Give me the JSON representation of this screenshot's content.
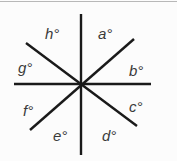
{
  "diagram": {
    "type": "intersecting-lines-angles",
    "center": [
      81,
      84
    ],
    "line_color": "#1a1a1a",
    "label_color": "#3a3a3a",
    "border_color": "#b8b8b8",
    "lines": [
      {
        "name": "vertical-line",
        "x1": 81,
        "y1": 14,
        "x2": 81,
        "y2": 155
      },
      {
        "name": "horizontal-line",
        "x1": 14,
        "y1": 84,
        "x2": 151,
        "y2": 84
      },
      {
        "name": "diagonal-rising-line",
        "x1": 30,
        "y1": 130,
        "x2": 134,
        "y2": 39
      },
      {
        "name": "diagonal-falling-line",
        "x1": 26,
        "y1": 43,
        "x2": 137,
        "y2": 126
      }
    ],
    "labels": {
      "a": "a°",
      "b": "b°",
      "c": "c°",
      "d": "d°",
      "e": "e°",
      "f": "f°",
      "g": "g°",
      "h": "h°"
    }
  }
}
